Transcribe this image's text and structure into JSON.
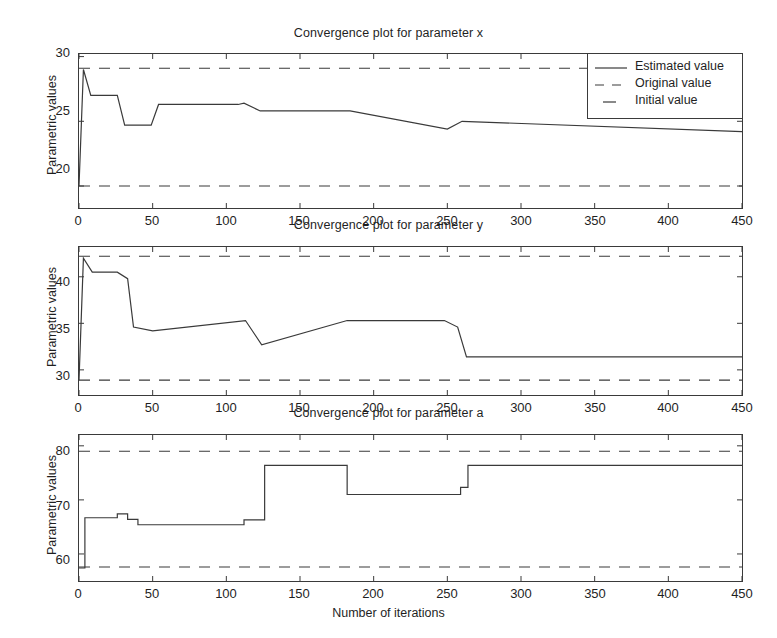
{
  "figure": {
    "width": 777,
    "height": 638,
    "xlabel": "Number of iterations",
    "background": "#ffffff",
    "line_color": "#3a3a3a"
  },
  "legend": {
    "position": "top-right-panel-1",
    "entries": [
      {
        "label": "Estimated value",
        "style": "solid",
        "icon": "solid-line-icon"
      },
      {
        "label": "Original value",
        "style": "dashed",
        "icon": "dashed-line-icon"
      },
      {
        "label": "Initial value",
        "style": "dash",
        "icon": "dash-line-icon"
      }
    ]
  },
  "chart_data": [
    {
      "type": "line",
      "title": "Convergence plot for parameter x",
      "xlabel": "",
      "ylabel": "Parametric values",
      "xlim": [
        0,
        450
      ],
      "ylim": [
        18.3,
        30.2
      ],
      "xticks": [
        0,
        50,
        100,
        150,
        200,
        250,
        300,
        350,
        400,
        450
      ],
      "yticks": [
        20,
        25,
        30
      ],
      "grid": false,
      "legend_position": "upper right",
      "reference_lines": [
        {
          "name": "Original value",
          "value": 29.1,
          "style": "dashed"
        },
        {
          "name": "Initial value",
          "value": 20.0,
          "style": "dashed"
        }
      ],
      "series": [
        {
          "name": "Estimated value",
          "style": "solid",
          "x": [
            0,
            3,
            3,
            8,
            8,
            26,
            26,
            31,
            31,
            49,
            49,
            54,
            54,
            108,
            108,
            112,
            112,
            123,
            123,
            184,
            184,
            250,
            250,
            260,
            260,
            450
          ],
          "y": [
            20.0,
            29.0,
            29.0,
            27.0,
            27.0,
            27.0,
            27.0,
            24.7,
            24.7,
            24.7,
            24.7,
            26.3,
            26.3,
            26.3,
            26.3,
            26.4,
            26.4,
            25.8,
            25.8,
            25.8,
            25.8,
            24.4,
            24.4,
            25.0,
            25.0,
            24.2
          ]
        }
      ]
    },
    {
      "type": "line",
      "title": "Convergence plot for parameter y",
      "xlabel": "",
      "ylabel": "Parametric values",
      "xlim": [
        0,
        450
      ],
      "ylim": [
        27.3,
        43.2
      ],
      "xticks": [
        0,
        50,
        100,
        150,
        200,
        250,
        300,
        350,
        400,
        450
      ],
      "yticks": [
        30,
        35,
        40
      ],
      "grid": false,
      "reference_lines": [
        {
          "name": "Original value",
          "value": 42.2,
          "style": "dashed"
        },
        {
          "name": "Initial value",
          "value": 28.9,
          "style": "dashed"
        }
      ],
      "series": [
        {
          "name": "Estimated value",
          "style": "solid",
          "x": [
            0,
            3,
            3,
            9,
            9,
            26,
            26,
            33,
            33,
            37,
            37,
            50,
            50,
            113,
            113,
            124,
            124,
            182,
            182,
            248,
            248,
            257,
            257,
            263,
            263,
            450
          ],
          "y": [
            28.9,
            42.0,
            42.0,
            40.5,
            40.5,
            40.5,
            40.5,
            39.8,
            39.8,
            34.6,
            34.6,
            34.2,
            34.2,
            35.3,
            35.3,
            32.7,
            32.7,
            35.3,
            35.3,
            35.3,
            35.3,
            34.6,
            34.6,
            31.4,
            31.4,
            31.4
          ]
        }
      ]
    },
    {
      "type": "line",
      "title": "Convergence plot for parameter a",
      "xlabel": "Number of iterations",
      "ylabel": "Parametric values",
      "xlim": [
        0,
        450
      ],
      "ylim": [
        55.0,
        82.0
      ],
      "xticks": [
        0,
        50,
        100,
        150,
        200,
        250,
        300,
        350,
        400,
        450
      ],
      "yticks": [
        60,
        70,
        80
      ],
      "grid": false,
      "reference_lines": [
        {
          "name": "Original value",
          "value": 79.0,
          "style": "dashed"
        },
        {
          "name": "Initial value",
          "value": 57.6,
          "style": "dashed"
        }
      ],
      "series": [
        {
          "name": "Estimated value",
          "style": "solid",
          "x": [
            0,
            4,
            4,
            9,
            9,
            26,
            26,
            33,
            33,
            40,
            40,
            50,
            50,
            112,
            112,
            126,
            126,
            182,
            182,
            248,
            248,
            259,
            259,
            264,
            264,
            450
          ],
          "y": [
            57.4,
            57.4,
            66.7,
            66.7,
            66.7,
            66.7,
            67.4,
            67.4,
            66.4,
            66.4,
            65.4,
            65.4,
            65.4,
            65.4,
            66.3,
            66.3,
            76.4,
            76.4,
            71.0,
            71.0,
            71.0,
            71.0,
            72.3,
            72.3,
            76.4,
            76.4
          ]
        }
      ]
    }
  ]
}
